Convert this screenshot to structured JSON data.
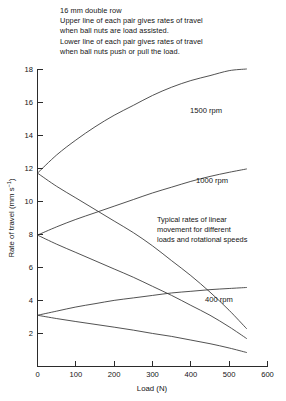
{
  "header": {
    "lines": [
      "16 mm double row",
      "Upper line of each pair gives rates of travel",
      "when ball nuts are load assisted.",
      "Lower line of each pair gives rates of travel",
      "when ball nuts push or pull the load."
    ]
  },
  "annotation": {
    "lines": [
      "Typical rates of linear",
      "movement for different",
      "loads and rotational speeds"
    ]
  },
  "axes": {
    "x_title": "Load (N)",
    "y_title_main": "Rate of travel (mm s",
    "y_title_exponent": "−1",
    "y_title_close": ")",
    "x_ticks": [
      "0",
      "100",
      "200",
      "300",
      "400",
      "500",
      "600"
    ],
    "y_ticks": [
      "0",
      "2",
      "4",
      "6",
      "8",
      "10",
      "12",
      "14",
      "16",
      "18"
    ]
  },
  "series_labels": {
    "rpm1500": "1500 rpm",
    "rpm1000": "1000 rpm",
    "rpm400": "400 rpm"
  },
  "chart_data": {
    "type": "line",
    "title": "16 mm double row",
    "subtitle": "Typical rates of linear movement for different loads and rotational speeds",
    "xlabel": "Load (N)",
    "ylabel": "Rate of travel (mm s⁻¹)",
    "xlim": [
      0,
      600
    ],
    "ylim": [
      0,
      18
    ],
    "xticks": [
      0,
      100,
      200,
      300,
      400,
      500,
      600
    ],
    "yticks": [
      0,
      2,
      4,
      6,
      8,
      10,
      12,
      14,
      16,
      18
    ],
    "grid": false,
    "legend": "inline-annotations",
    "series": [
      {
        "name": "1500 rpm - load assisted (upper)",
        "speed_rpm": 1500,
        "condition": "load assisted",
        "x": [
          0,
          50,
          100,
          150,
          200,
          250,
          300,
          350,
          400,
          450,
          500,
          545
        ],
        "y": [
          11.7,
          12.8,
          13.7,
          14.5,
          15.2,
          15.8,
          16.4,
          16.9,
          17.3,
          17.6,
          17.9,
          18.0
        ]
      },
      {
        "name": "1500 rpm - push or pull load (lower)",
        "speed_rpm": 1500,
        "condition": "push or pull the load",
        "x": [
          0,
          50,
          100,
          150,
          200,
          250,
          300,
          350,
          400,
          450,
          500,
          545
        ],
        "y": [
          11.7,
          10.9,
          10.2,
          9.5,
          8.8,
          8.1,
          7.3,
          6.4,
          5.5,
          4.5,
          3.4,
          2.3
        ]
      },
      {
        "name": "1000 rpm - load assisted (upper)",
        "speed_rpm": 1000,
        "condition": "load assisted",
        "x": [
          0,
          50,
          100,
          150,
          200,
          250,
          300,
          350,
          400,
          450,
          500,
          545
        ],
        "y": [
          7.95,
          8.45,
          8.9,
          9.3,
          9.7,
          10.1,
          10.5,
          10.85,
          11.2,
          11.5,
          11.75,
          11.95
        ]
      },
      {
        "name": "1000 rpm - push or pull load (lower)",
        "speed_rpm": 1000,
        "condition": "push or pull the load",
        "x": [
          0,
          50,
          100,
          150,
          200,
          250,
          300,
          350,
          400,
          450,
          500,
          545
        ],
        "y": [
          7.95,
          7.4,
          6.9,
          6.4,
          5.9,
          5.4,
          4.85,
          4.3,
          3.7,
          3.1,
          2.4,
          1.7
        ]
      },
      {
        "name": "400 rpm - load assisted (upper)",
        "speed_rpm": 400,
        "condition": "load assisted",
        "x": [
          0,
          50,
          100,
          150,
          200,
          250,
          300,
          350,
          400,
          450,
          500,
          545
        ],
        "y": [
          3.1,
          3.35,
          3.6,
          3.8,
          4.0,
          4.15,
          4.3,
          4.45,
          4.55,
          4.65,
          4.72,
          4.78
        ]
      },
      {
        "name": "400 rpm - push or pull load (lower)",
        "speed_rpm": 400,
        "condition": "push or pull the load",
        "x": [
          0,
          50,
          100,
          150,
          200,
          250,
          300,
          350,
          400,
          450,
          500,
          545
        ],
        "y": [
          3.1,
          2.9,
          2.72,
          2.55,
          2.38,
          2.2,
          2.0,
          1.82,
          1.6,
          1.38,
          1.12,
          0.85
        ]
      }
    ]
  },
  "style": {
    "curve_color": "#333333",
    "axis_color": "#2b2b2b",
    "text_color": "#141414",
    "background": "#ffffff"
  }
}
